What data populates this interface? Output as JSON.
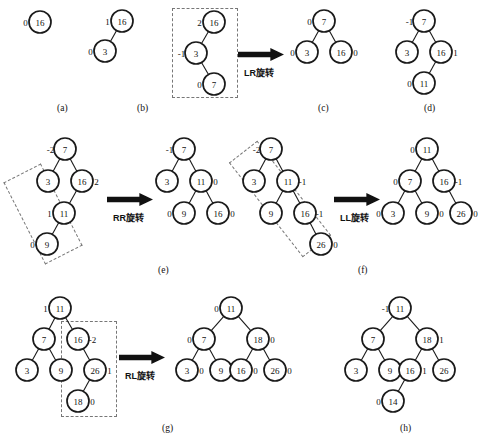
{
  "figure": {
    "captions": [
      {
        "id": "a",
        "label": "(a)",
        "x": 57,
        "y": 103
      },
      {
        "id": "b",
        "label": "(b)",
        "x": 137,
        "y": 103
      },
      {
        "id": "c",
        "label": "(c)",
        "x": 318,
        "y": 103
      },
      {
        "id": "d",
        "label": "(d)",
        "x": 424,
        "y": 103
      },
      {
        "id": "e",
        "label": "(e)",
        "x": 158,
        "y": 265
      },
      {
        "id": "f",
        "label": "(f)",
        "x": 358,
        "y": 265
      },
      {
        "id": "g",
        "label": "(g)",
        "x": 162,
        "y": 423
      },
      {
        "id": "h",
        "label": "(h)",
        "x": 400,
        "y": 423
      }
    ],
    "operations": [
      {
        "id": "lr",
        "label": "LR旋转",
        "x": 244,
        "y": 66
      },
      {
        "id": "rr",
        "label": "RR旋转",
        "x": 113,
        "y": 211
      },
      {
        "id": "ll",
        "label": "LL旋转",
        "x": 340,
        "y": 211
      },
      {
        "id": "rl",
        "label": "RL旋转",
        "x": 125,
        "y": 369
      }
    ],
    "arrows": [
      {
        "id": "arrow-lr",
        "x": 238,
        "y": 48,
        "w": 46,
        "h": 13
      },
      {
        "id": "arrow-rr",
        "x": 107,
        "y": 193,
        "w": 46,
        "h": 13
      },
      {
        "id": "arrow-ll",
        "x": 334,
        "y": 193,
        "w": 46,
        "h": 13
      },
      {
        "id": "arrow-rl",
        "x": 119,
        "y": 351,
        "w": 46,
        "h": 13
      }
    ],
    "highlight_boxes": [
      {
        "id": "box-c",
        "x": 172,
        "y": 8,
        "w": 66,
        "h": 90,
        "rotate": 0
      },
      {
        "id": "box-e",
        "x": 22,
        "y": 168,
        "w": 42,
        "h": 92,
        "rotate": -27
      },
      {
        "id": "box-f",
        "x": 262,
        "y": 139,
        "w": 36,
        "h": 120,
        "rotate": -38
      },
      {
        "id": "box-g",
        "x": 61,
        "y": 321,
        "w": 56,
        "h": 96,
        "rotate": 0
      }
    ],
    "trees": [
      {
        "id": "tree-a",
        "nodes": [
          {
            "id": "a16",
            "value": "16",
            "cx": 40,
            "cy": 22,
            "r": 11,
            "bf": "0",
            "bf_side": "left"
          }
        ],
        "edges": []
      },
      {
        "id": "tree-b",
        "nodes": [
          {
            "id": "b16",
            "value": "16",
            "cx": 122,
            "cy": 21,
            "r": 11,
            "bf": "1",
            "bf_side": "left"
          },
          {
            "id": "b3",
            "value": "3",
            "cx": 105,
            "cy": 51,
            "r": 11,
            "bf": "0",
            "bf_side": "left"
          }
        ],
        "edges": [
          [
            "b16",
            "b3"
          ]
        ]
      },
      {
        "id": "tree-c-before",
        "nodes": [
          {
            "id": "c16",
            "value": "16",
            "cx": 214,
            "cy": 22,
            "r": 11,
            "bf": "2",
            "bf_side": "left"
          },
          {
            "id": "c3",
            "value": "3",
            "cx": 196,
            "cy": 53,
            "r": 11,
            "bf": "-1",
            "bf_side": "left"
          },
          {
            "id": "c7",
            "value": "7",
            "cx": 214,
            "cy": 84,
            "r": 11,
            "bf": "0",
            "bf_side": "left"
          }
        ],
        "edges": [
          [
            "c16",
            "c3"
          ],
          [
            "c3",
            "c7"
          ]
        ]
      },
      {
        "id": "tree-c-after",
        "nodes": [
          {
            "id": "c2_7",
            "value": "7",
            "cx": 324,
            "cy": 21,
            "r": 11,
            "bf": "0",
            "bf_side": "left"
          },
          {
            "id": "c2_3",
            "value": "3",
            "cx": 307,
            "cy": 52,
            "r": 11,
            "bf": "0",
            "bf_side": "left"
          },
          {
            "id": "c2_16",
            "value": "16",
            "cx": 341,
            "cy": 52,
            "r": 11,
            "bf": "0",
            "bf_side": "right"
          }
        ],
        "edges": [
          [
            "c2_7",
            "c2_3"
          ],
          [
            "c2_7",
            "c2_16"
          ]
        ]
      },
      {
        "id": "tree-d",
        "nodes": [
          {
            "id": "d7",
            "value": "7",
            "cx": 424,
            "cy": 21,
            "r": 11,
            "bf": "-1",
            "bf_side": "left"
          },
          {
            "id": "d3",
            "value": "3",
            "cx": 407,
            "cy": 52,
            "r": 11,
            "bf": "",
            "bf_side": "left"
          },
          {
            "id": "d16",
            "value": "16",
            "cx": 441,
            "cy": 52,
            "r": 11,
            "bf": "1",
            "bf_side": "right"
          },
          {
            "id": "d11",
            "value": "11",
            "cx": 424,
            "cy": 83,
            "r": 11,
            "bf": "0",
            "bf_side": "left"
          }
        ],
        "edges": [
          [
            "d7",
            "d3"
          ],
          [
            "d7",
            "d16"
          ],
          [
            "d16",
            "d11"
          ]
        ]
      },
      {
        "id": "tree-e-before",
        "nodes": [
          {
            "id": "e7",
            "value": "7",
            "cx": 65,
            "cy": 149,
            "r": 11,
            "bf": "-2",
            "bf_side": "left"
          },
          {
            "id": "e3",
            "value": "3",
            "cx": 48,
            "cy": 181,
            "r": 11,
            "bf": "",
            "bf_side": "left"
          },
          {
            "id": "e16",
            "value": "16",
            "cx": 82,
            "cy": 181,
            "r": 11,
            "bf": "2",
            "bf_side": "right"
          },
          {
            "id": "e11",
            "value": "11",
            "cx": 64,
            "cy": 213,
            "r": 11,
            "bf": "1",
            "bf_side": "left"
          },
          {
            "id": "e9",
            "value": "9",
            "cx": 47,
            "cy": 244,
            "r": 11,
            "bf": "0",
            "bf_side": "left"
          }
        ],
        "edges": [
          [
            "e7",
            "e3"
          ],
          [
            "e7",
            "e16"
          ],
          [
            "e16",
            "e11"
          ],
          [
            "e11",
            "e9"
          ]
        ]
      },
      {
        "id": "tree-e-after",
        "nodes": [
          {
            "id": "e2_7",
            "value": "7",
            "cx": 184,
            "cy": 149,
            "r": 11,
            "bf": "-1",
            "bf_side": "left"
          },
          {
            "id": "e2_3",
            "value": "3",
            "cx": 167,
            "cy": 181,
            "r": 11,
            "bf": "",
            "bf_side": "left"
          },
          {
            "id": "e2_11",
            "value": "11",
            "cx": 201,
            "cy": 181,
            "r": 11,
            "bf": "0",
            "bf_side": "right"
          },
          {
            "id": "e2_9",
            "value": "9",
            "cx": 184,
            "cy": 213,
            "r": 11,
            "bf": "0",
            "bf_side": "left"
          },
          {
            "id": "e2_16",
            "value": "16",
            "cx": 218,
            "cy": 213,
            "r": 11,
            "bf": "0",
            "bf_side": "right"
          }
        ],
        "edges": [
          [
            "e2_7",
            "e2_3"
          ],
          [
            "e2_7",
            "e2_11"
          ],
          [
            "e2_11",
            "e2_9"
          ],
          [
            "e2_11",
            "e2_16"
          ]
        ]
      },
      {
        "id": "tree-f-before",
        "nodes": [
          {
            "id": "f7",
            "value": "7",
            "cx": 271,
            "cy": 149,
            "r": 11,
            "bf": "-2",
            "bf_side": "left"
          },
          {
            "id": "f3",
            "value": "3",
            "cx": 254,
            "cy": 181,
            "r": 11,
            "bf": "",
            "bf_side": "left"
          },
          {
            "id": "f11",
            "value": "11",
            "cx": 288,
            "cy": 181,
            "r": 11,
            "bf": "-1",
            "bf_side": "right"
          },
          {
            "id": "f9",
            "value": "9",
            "cx": 271,
            "cy": 213,
            "r": 11,
            "bf": "",
            "bf_side": "left"
          },
          {
            "id": "f16",
            "value": "16",
            "cx": 305,
            "cy": 213,
            "r": 11,
            "bf": "-1",
            "bf_side": "right"
          },
          {
            "id": "f26",
            "value": "26",
            "cx": 321,
            "cy": 244,
            "r": 11,
            "bf": "0",
            "bf_side": "right"
          }
        ],
        "edges": [
          [
            "f7",
            "f3"
          ],
          [
            "f7",
            "f11"
          ],
          [
            "f11",
            "f9"
          ],
          [
            "f11",
            "f16"
          ],
          [
            "f16",
            "f26"
          ]
        ]
      },
      {
        "id": "tree-f-after",
        "nodes": [
          {
            "id": "f2_11",
            "value": "11",
            "cx": 427,
            "cy": 149,
            "r": 11,
            "bf": "0",
            "bf_side": "left"
          },
          {
            "id": "f2_7",
            "value": "7",
            "cx": 410,
            "cy": 181,
            "r": 11,
            "bf": "0",
            "bf_side": "left"
          },
          {
            "id": "f2_16",
            "value": "16",
            "cx": 444,
            "cy": 181,
            "r": 11,
            "bf": "-1",
            "bf_side": "right"
          },
          {
            "id": "f2_3",
            "value": "3",
            "cx": 393,
            "cy": 213,
            "r": 11,
            "bf": "0",
            "bf_side": "left"
          },
          {
            "id": "f2_9",
            "value": "9",
            "cx": 427,
            "cy": 213,
            "r": 11,
            "bf": "0",
            "bf_side": "right"
          },
          {
            "id": "f2_26",
            "value": "26",
            "cx": 461,
            "cy": 213,
            "r": 11,
            "bf": "0",
            "bf_side": "right"
          }
        ],
        "edges": [
          [
            "f2_11",
            "f2_7"
          ],
          [
            "f2_11",
            "f2_16"
          ],
          [
            "f2_7",
            "f2_3"
          ],
          [
            "f2_7",
            "f2_9"
          ],
          [
            "f2_16",
            "f2_26"
          ]
        ]
      },
      {
        "id": "tree-g-before",
        "nodes": [
          {
            "id": "g11",
            "value": "11",
            "cx": 60,
            "cy": 308,
            "r": 11,
            "bf": "1",
            "bf_side": "left"
          },
          {
            "id": "g7",
            "value": "7",
            "cx": 44,
            "cy": 339,
            "r": 11,
            "bf": "",
            "bf_side": "left"
          },
          {
            "id": "g16",
            "value": "16",
            "cx": 78,
            "cy": 339,
            "r": 11,
            "bf": "-2",
            "bf_side": "right"
          },
          {
            "id": "g3",
            "value": "3",
            "cx": 27,
            "cy": 370,
            "r": 11,
            "bf": "",
            "bf_side": "left"
          },
          {
            "id": "g9",
            "value": "9",
            "cx": 61,
            "cy": 370,
            "r": 11,
            "bf": "",
            "bf_side": "left"
          },
          {
            "id": "g26",
            "value": "26",
            "cx": 95,
            "cy": 370,
            "r": 11,
            "bf": "1",
            "bf_side": "right"
          },
          {
            "id": "g18",
            "value": "18",
            "cx": 78,
            "cy": 401,
            "r": 11,
            "bf": "0",
            "bf_side": "right"
          }
        ],
        "edges": [
          [
            "g11",
            "g7"
          ],
          [
            "g11",
            "g16"
          ],
          [
            "g7",
            "g3"
          ],
          [
            "g7",
            "g9"
          ],
          [
            "g16",
            "g26"
          ],
          [
            "g26",
            "g18"
          ]
        ]
      },
      {
        "id": "tree-g-after",
        "nodes": [
          {
            "id": "g2_11",
            "value": "11",
            "cx": 231,
            "cy": 308,
            "r": 11,
            "bf": "0",
            "bf_side": "left"
          },
          {
            "id": "g2_7",
            "value": "7",
            "cx": 204,
            "cy": 339,
            "r": 11,
            "bf": "0",
            "bf_side": "left"
          },
          {
            "id": "g2_18",
            "value": "18",
            "cx": 258,
            "cy": 339,
            "r": 11,
            "bf": "0",
            "bf_side": "right"
          },
          {
            "id": "g2_3",
            "value": "3",
            "cx": 187,
            "cy": 370,
            "r": 11,
            "bf": "0",
            "bf_side": "right"
          },
          {
            "id": "g2_9",
            "value": "9",
            "cx": 221,
            "cy": 370,
            "r": 11,
            "bf": "",
            "bf_side": "left"
          },
          {
            "id": "g2_16",
            "value": "16",
            "cx": 241,
            "cy": 370,
            "r": 11,
            "bf": "0",
            "bf_side": "right"
          },
          {
            "id": "g2_26",
            "value": "26",
            "cx": 275,
            "cy": 370,
            "r": 11,
            "bf": "0",
            "bf_side": "right"
          }
        ],
        "edges": [
          [
            "g2_11",
            "g2_7"
          ],
          [
            "g2_11",
            "g2_18"
          ],
          [
            "g2_7",
            "g2_3"
          ],
          [
            "g2_7",
            "g2_9"
          ],
          [
            "g2_18",
            "g2_16"
          ],
          [
            "g2_18",
            "g2_26"
          ]
        ]
      },
      {
        "id": "tree-h",
        "nodes": [
          {
            "id": "h11",
            "value": "11",
            "cx": 400,
            "cy": 308,
            "r": 11,
            "bf": "-1",
            "bf_side": "left"
          },
          {
            "id": "h7",
            "value": "7",
            "cx": 373,
            "cy": 339,
            "r": 11,
            "bf": "",
            "bf_side": "left"
          },
          {
            "id": "h18",
            "value": "18",
            "cx": 427,
            "cy": 339,
            "r": 11,
            "bf": "1",
            "bf_side": "right"
          },
          {
            "id": "h3",
            "value": "3",
            "cx": 356,
            "cy": 370,
            "r": 11,
            "bf": "",
            "bf_side": "left"
          },
          {
            "id": "h9",
            "value": "9",
            "cx": 390,
            "cy": 370,
            "r": 11,
            "bf": "",
            "bf_side": "left"
          },
          {
            "id": "h16",
            "value": "16",
            "cx": 410,
            "cy": 370,
            "r": 11,
            "bf": "1",
            "bf_side": "right"
          },
          {
            "id": "h26",
            "value": "26",
            "cx": 444,
            "cy": 370,
            "r": 11,
            "bf": "",
            "bf_side": "right"
          },
          {
            "id": "h14",
            "value": "14",
            "cx": 393,
            "cy": 401,
            "r": 11,
            "bf": "0",
            "bf_side": "left"
          }
        ],
        "edges": [
          [
            "h11",
            "h7"
          ],
          [
            "h11",
            "h18"
          ],
          [
            "h7",
            "h3"
          ],
          [
            "h7",
            "h9"
          ],
          [
            "h18",
            "h16"
          ],
          [
            "h18",
            "h26"
          ],
          [
            "h16",
            "h14"
          ]
        ]
      }
    ]
  }
}
